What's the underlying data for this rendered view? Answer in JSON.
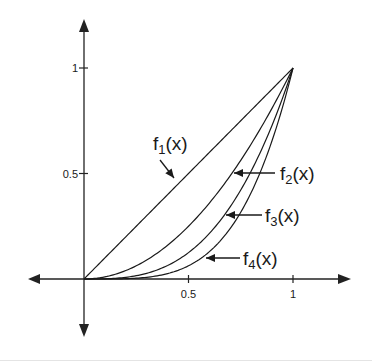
{
  "chart_data": {
    "type": "line",
    "title": "",
    "xlabel": "",
    "ylabel": "",
    "xlim": [
      -0.27,
      1.27
    ],
    "ylim": [
      -0.27,
      1.25
    ],
    "grid": false,
    "legend": "inline labels with arrows",
    "x_ticks": [
      {
        "value": 0.5,
        "label": "0.5"
      },
      {
        "value": 1,
        "label": "1"
      }
    ],
    "y_ticks": [
      {
        "value": 0.5,
        "label": "0.5"
      },
      {
        "value": 1,
        "label": "1"
      }
    ],
    "series": [
      {
        "name": "f1(x)",
        "sub": "1",
        "exponent": 1,
        "x": [
          0,
          0.25,
          0.5,
          0.75,
          1
        ],
        "values": [
          0,
          0.25,
          0.5,
          0.75,
          1
        ]
      },
      {
        "name": "f2(x)",
        "sub": "2",
        "exponent": 2,
        "x": [
          0,
          0.25,
          0.5,
          0.75,
          1
        ],
        "values": [
          0,
          0.0625,
          0.25,
          0.5625,
          1
        ]
      },
      {
        "name": "f3(x)",
        "sub": "3",
        "exponent": 3,
        "x": [
          0,
          0.25,
          0.5,
          0.75,
          1
        ],
        "values": [
          0,
          0.0156,
          0.125,
          0.4219,
          1
        ]
      },
      {
        "name": "f4(x)",
        "sub": "4",
        "exponent": 4,
        "x": [
          0,
          0.25,
          0.5,
          0.75,
          1
        ],
        "values": [
          0,
          0.0039,
          0.0625,
          0.3164,
          1
        ]
      }
    ],
    "annotations": [
      {
        "series": "f1(x)",
        "label_pos": [
          153,
          150
        ],
        "arrow_from": [
          160,
          160
        ],
        "arrow_to": [
          174,
          178
        ]
      },
      {
        "series": "f2(x)",
        "label_pos": [
          280,
          180
        ],
        "arrow_from": [
          275,
          173
        ],
        "arrow_to": [
          234,
          173
        ]
      },
      {
        "series": "f3(x)",
        "label_pos": [
          265,
          222
        ],
        "arrow_from": [
          262,
          215
        ],
        "arrow_to": [
          226,
          215
        ]
      },
      {
        "series": "f4(x)",
        "label_pos": [
          243,
          265
        ],
        "arrow_from": [
          240,
          258
        ],
        "arrow_to": [
          206,
          258
        ]
      }
    ]
  },
  "style": {
    "ink": "#1a1a1a",
    "axis": "#222222"
  }
}
